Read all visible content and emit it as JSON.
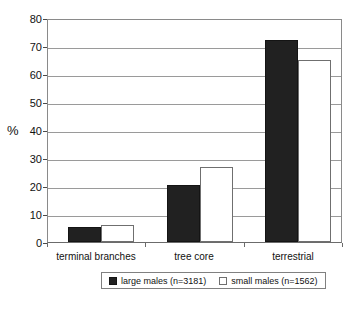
{
  "chart_data": {
    "type": "bar",
    "title": "",
    "subtitle": "",
    "xlabel": "",
    "ylabel": "%",
    "ylim": [
      0,
      80
    ],
    "yticks": [
      0,
      10,
      20,
      30,
      40,
      50,
      60,
      70,
      80
    ],
    "ytick_labels": [
      "0",
      "10",
      "20",
      "30",
      "40",
      "50",
      "60",
      "70",
      "80"
    ],
    "grid": "horizontal",
    "legend_position": "bottom",
    "categories": [
      "terminal branches",
      "tree core",
      "terrestrial"
    ],
    "series": [
      {
        "name": "large males (n=3181)",
        "color": "#212121",
        "values": [
          5.5,
          20.5,
          72
        ]
      },
      {
        "name": "small males (n=1562)",
        "color": "#ffffff",
        "values": [
          6,
          26.7,
          65
        ]
      }
    ]
  },
  "axis": {
    "y_title": "%"
  },
  "legend": {
    "entries": [
      {
        "label": "large males (n=3181)",
        "swatch": "filled-dark-square"
      },
      {
        "label": "small males (n=1562)",
        "swatch": "open-white-square"
      }
    ]
  },
  "colors": {
    "series_dark": "#212121",
    "series_light": "#ffffff",
    "gridline": "#9a9a9a",
    "axis": "#6b6b6b",
    "text": "#111111",
    "background": "#ffffff"
  }
}
